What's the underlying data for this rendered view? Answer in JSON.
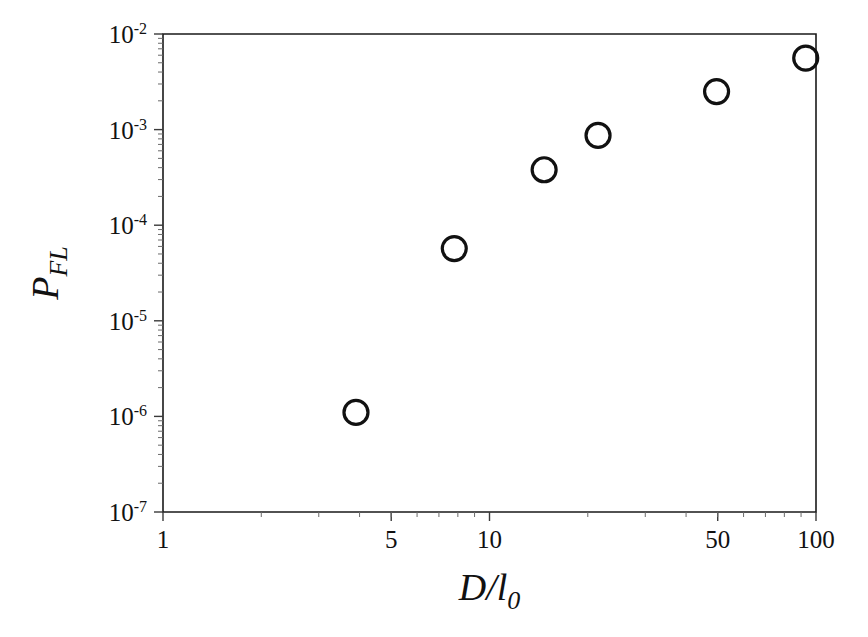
{
  "chart_data": {
    "type": "scatter",
    "title": "",
    "xlabel": "D/l0",
    "xlabel_main": "D/l",
    "xlabel_subscript": "0",
    "ylabel": "P_FL",
    "ylabel_main": "P",
    "ylabel_subscript": "FL",
    "xscale": "log",
    "yscale": "log",
    "xlim": [
      1,
      100
    ],
    "ylim": [
      1e-07,
      0.01
    ],
    "grid": false,
    "legend": null,
    "x_tick_labels": [
      "1",
      "5",
      "10",
      "50",
      "100"
    ],
    "x_tick_values": [
      1,
      5,
      10,
      50,
      100
    ],
    "y_tick_labels": [
      "10-2",
      "10-3",
      "10-4",
      "10-5",
      "10-6",
      "10-7"
    ],
    "y_tick_mantissa": "10",
    "y_tick_exponents": [
      "-2",
      "-3",
      "-4",
      "-5",
      "-6",
      "-7"
    ],
    "y_tick_values": [
      0.01,
      0.001,
      0.0001,
      1e-05,
      1e-06,
      1e-07
    ],
    "marker_style": "open-circle",
    "marker_color": "#111111",
    "x": [
      3.9,
      7.8,
      14.7,
      21.5,
      49.6,
      93.0
    ],
    "y": [
      1.1e-06,
      5.7e-05,
      0.00038,
      0.00087,
      0.0025,
      0.0056
    ],
    "points": [
      {
        "x": 3.9,
        "y": 1.1e-06
      },
      {
        "x": 7.8,
        "y": 5.7e-05
      },
      {
        "x": 14.7,
        "y": 0.00038
      },
      {
        "x": 21.5,
        "y": 0.00087
      },
      {
        "x": 49.6,
        "y": 0.0025
      },
      {
        "x": 93.0,
        "y": 0.0056
      }
    ]
  },
  "layout": {
    "plot_left": 163,
    "plot_right": 816,
    "plot_top": 34,
    "plot_bottom": 512,
    "background": "#ffffff",
    "axis_color": "#1a1a1a"
  }
}
